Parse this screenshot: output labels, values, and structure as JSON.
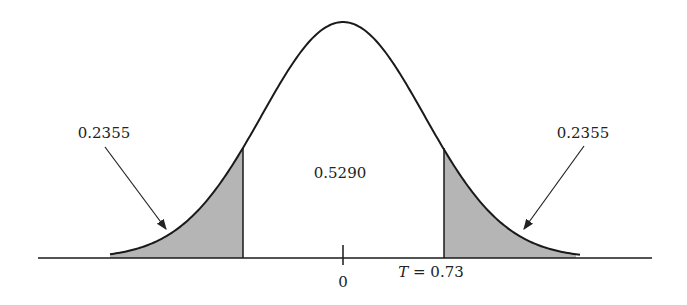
{
  "chart_data": {
    "type": "area",
    "title": "",
    "xlabel": "",
    "ylabel": "",
    "center_label": "0",
    "cutoff_label": "T = 0.73",
    "cutoff_value": 0.73,
    "regions": [
      {
        "name": "left-tail",
        "value": 0.2355,
        "label": "0.2355",
        "shaded": true
      },
      {
        "name": "middle",
        "value": 0.529,
        "label": "0.5290",
        "shaded": false
      },
      {
        "name": "right-tail",
        "value": 0.2355,
        "label": "0.2355",
        "shaded": true
      }
    ],
    "grid": false,
    "legend": "none"
  },
  "labels": {
    "left_tail": "0.2355",
    "middle": "0.5290",
    "right_tail": "0.2355",
    "zero": "0",
    "cutoff_T": "T",
    "cutoff_rest": " = 0.73"
  },
  "colors": {
    "curve": "#1a1a1a",
    "shade": "#b5b5b5"
  }
}
